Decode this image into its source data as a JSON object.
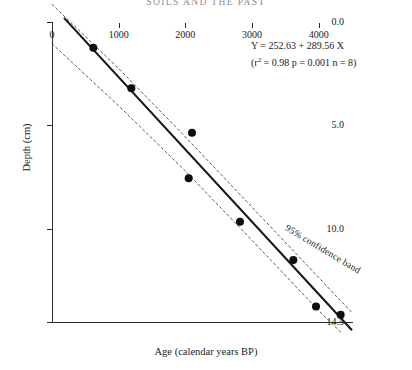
{
  "header": {
    "running_head": "SOILS AND THE PAST"
  },
  "annotations": {
    "equation": "Y = 252.63 + 289.56 X",
    "stats_prefix": "(r",
    "stats_sup": "2",
    "stats_rest": " = 0.98 p = 0.001 n = 8)",
    "confidence_band": "95% confidence band"
  },
  "chart_data": {
    "type": "scatter",
    "title": "",
    "xlabel": "Age (calendar years BP)",
    "ylabel": "Depth (cm)",
    "xlim": [
      0,
      4500
    ],
    "ylim": [
      0,
      14.5
    ],
    "y_inverted": true,
    "grid": false,
    "legend": "none",
    "xticks": [
      0,
      1000,
      2000,
      3000,
      4000
    ],
    "xtick_labels": [
      "0",
      "1000",
      "2000",
      "3000",
      "4000"
    ],
    "yticks": [
      0.0,
      5.0,
      10.0,
      14.5
    ],
    "ytick_labels": [
      "0.0",
      "5.0",
      "10.0",
      "14.5"
    ],
    "points": [
      {
        "x": 620,
        "y": 1.25
      },
      {
        "x": 1190,
        "y": 3.2
      },
      {
        "x": 2100,
        "y": 5.35
      },
      {
        "x": 2050,
        "y": 7.55
      },
      {
        "x": 2820,
        "y": 9.65
      },
      {
        "x": 3620,
        "y": 11.5
      },
      {
        "x": 3960,
        "y": 13.75
      },
      {
        "x": 4330,
        "y": 14.15
      }
    ],
    "fit_line": {
      "equation": "Y = 252.63 + 289.56 X",
      "r_squared": 0.98,
      "p_value": 0.001,
      "n": 8,
      "x_start": 180,
      "y_start": -0.2,
      "x_end": 4500,
      "y_end": 14.9
    },
    "confidence_band": {
      "level": 95,
      "label": "95% confidence band",
      "upper": [
        {
          "x": 0,
          "y": -0.85
        },
        {
          "x": 1000,
          "y": 2.25
        },
        {
          "x": 2000,
          "y": 5.55
        },
        {
          "x": 3000,
          "y": 8.95
        },
        {
          "x": 4000,
          "y": 12.35
        },
        {
          "x": 4500,
          "y": 14.05
        }
      ],
      "lower": [
        {
          "x": 0,
          "y": 1.05
        },
        {
          "x": 1000,
          "y": 4.05
        },
        {
          "x": 2000,
          "y": 7.2
        },
        {
          "x": 3000,
          "y": 10.55
        },
        {
          "x": 4000,
          "y": 13.95
        },
        {
          "x": 4350,
          "y": 15.05
        }
      ]
    }
  }
}
